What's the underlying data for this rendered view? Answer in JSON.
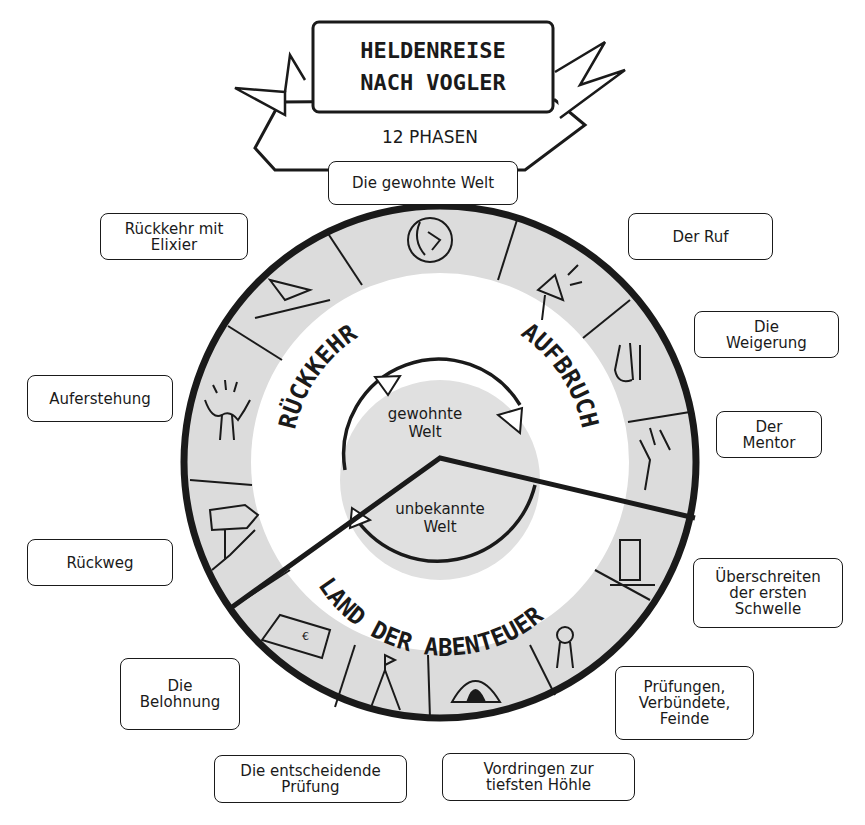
{
  "title": {
    "line1": "HELDENREISE",
    "line2": "NACH VOGLER",
    "subtitle": "12 PHASEN"
  },
  "colors": {
    "ink": "#1a1a1a",
    "ring_fill": "#dcdcdc",
    "inner_fill": "#e0e0e0",
    "background": "#ffffff"
  },
  "sections": {
    "departure": "AUFBRUCH",
    "return": "RÜCKKEHR",
    "adventure": "LAND DER ABENTEUER"
  },
  "center": {
    "known_world": "gewohnte\nWelt",
    "unknown_world": "unbekannte\nWelt"
  },
  "phases": [
    {
      "number": 1,
      "label": "Die gewohnte Welt",
      "icon": "globe-face-icon"
    },
    {
      "number": 2,
      "label": "Der Ruf",
      "icon": "megaphone-icon"
    },
    {
      "number": 3,
      "label": "Die\nWeigerung",
      "icon": "refusing-hand-icon"
    },
    {
      "number": 4,
      "label": "Der\nMentor",
      "icon": "mentor-whisper-icon"
    },
    {
      "number": 5,
      "label": "Überschreiten\nder ersten\nSchwelle",
      "icon": "door-threshold-icon"
    },
    {
      "number": 6,
      "label": "Prüfungen,\nVerbündete,\nFeinde",
      "icon": "rosette-ribbon-icon"
    },
    {
      "number": 7,
      "label": "Vordringen zur\ntiefsten Höhle",
      "icon": "cave-icon"
    },
    {
      "number": 8,
      "label": "Die entscheidende\nPrüfung",
      "icon": "summit-flag-icon"
    },
    {
      "number": 9,
      "label": "Die\nBelohnung",
      "icon": "money-stack-icon"
    },
    {
      "number": 10,
      "label": "Rückweg",
      "icon": "road-sign-arrow-icon"
    },
    {
      "number": 11,
      "label": "Auferstehung",
      "icon": "rising-figure-icon"
    },
    {
      "number": 12,
      "label": "Rückkehr mit\nElixier",
      "icon": "elixir-flask-icon"
    }
  ]
}
